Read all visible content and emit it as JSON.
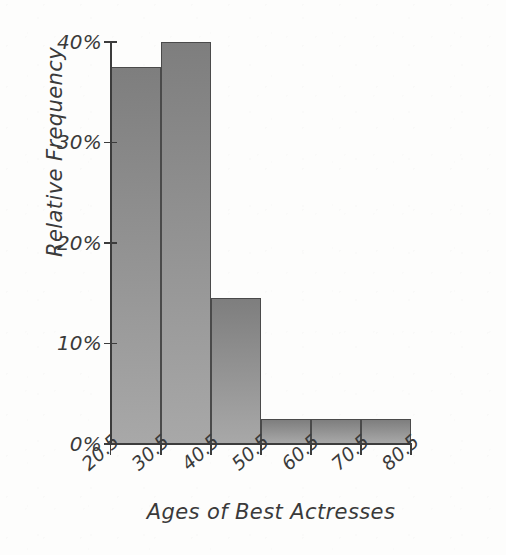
{
  "chart_data": {
    "type": "bar",
    "title": "",
    "subtitle": "",
    "xlabel": "Ages of Best Actresses",
    "ylabel": "Relative Frequency",
    "grid": false,
    "legend": false,
    "bin_edges": [
      20.5,
      30.5,
      40.5,
      50.5,
      60.5,
      70.5,
      80.5
    ],
    "bin_edge_labels": [
      "20.5",
      "30.5",
      "40.5",
      "50.5",
      "60.5",
      "70.5",
      "80.5"
    ],
    "categories": [
      "20.5-30.5",
      "30.5-40.5",
      "40.5-50.5",
      "50.5-60.5",
      "60.5-70.5",
      "70.5-80.5"
    ],
    "values": [
      37.5,
      40.0,
      14.5,
      2.5,
      2.5,
      2.5
    ],
    "value_labels": [
      "37.5%",
      "40%",
      "14.5%",
      "2.5%",
      "2.5%",
      "2.5%"
    ],
    "xlim": [
      20.5,
      80.5
    ],
    "ylim": [
      0,
      40
    ],
    "y_ticks": [
      0,
      10,
      20,
      30,
      40
    ],
    "y_tick_labels": [
      "0%",
      "10%",
      "20%",
      "30%",
      "40%"
    ],
    "bar_fill_top": "#7e7e7e",
    "bar_fill_bottom": "#a8a8a8",
    "bar_outline": "#4a4a4a",
    "axis_color": "#3c3c3c",
    "text_color": "#3a3a3a",
    "background": "#fdfdfc"
  }
}
